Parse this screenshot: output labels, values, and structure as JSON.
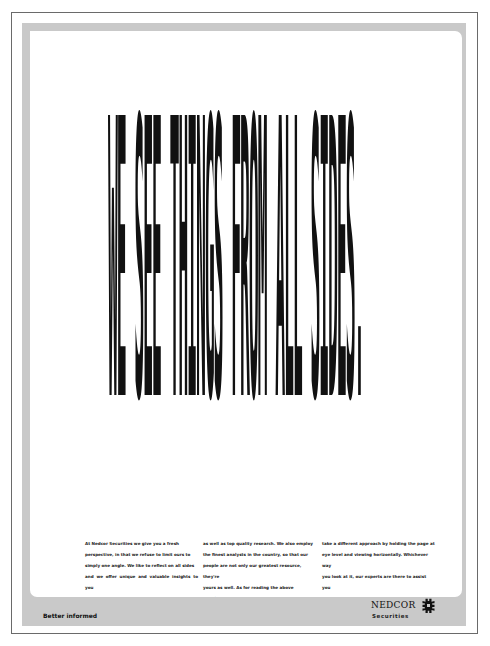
{
  "advert": {
    "headline": "WE SEE THINGS FROM ALL SIDES.",
    "body_columns": [
      [
        "At Nedcor Securities we give you a fresh",
        "perspective, in that we refuse to limit ours to",
        "simply one angle. We like to reflect on all sides",
        "and we offer unique and valuable insights to you"
      ],
      [
        "as well as top quality research. We also employ",
        "the finest analysts in the country, so that our",
        "people are not only our greatest resource, they're",
        "yours as well. As for reading the above headline,"
      ],
      [
        "take a different approach by holding the page at",
        "eye level and viewing horizontally. Whichever way",
        "you look at it, our experts are there to assist you",
        "in making your best investment decision."
      ]
    ],
    "tagline": "Better informed",
    "logo": {
      "wordmark": "NEDCOR",
      "subtitle": "Securities",
      "icon": "nedcor-cog-icon"
    },
    "colors": {
      "frame": "#c9c9c9",
      "ink": "#111111",
      "border": "#6a6a6a"
    }
  }
}
